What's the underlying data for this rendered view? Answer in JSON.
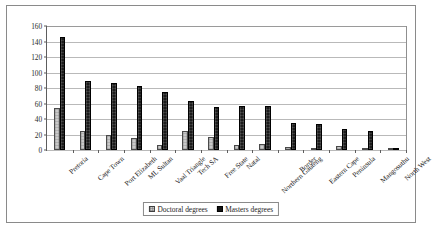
{
  "chart_data": {
    "type": "bar",
    "title": "",
    "subtitle": "",
    "xlabel": "",
    "ylabel": "",
    "ylim": [
      0,
      160
    ],
    "ytick_values": [
      0,
      20,
      40,
      60,
      80,
      100,
      120,
      140,
      160
    ],
    "ytick_labels": [
      "0",
      "20",
      "40",
      "60",
      "80",
      "100",
      "120",
      "140",
      "160"
    ],
    "grid": "horizontal",
    "legend_position": "bottom-center",
    "categories": [
      "Pretoria",
      "Cape Town",
      "Port Elizabeth",
      "ML Sultan",
      "Vaal Triangle",
      "Tech SA",
      "Free State",
      "Natal",
      "Northern Gauteng",
      "Border",
      "Eastern Cape",
      "Peninsula",
      "Mangosuthu",
      "North West"
    ],
    "series": [
      {
        "name": "Doctoral degrees",
        "color": "#c9c9c9",
        "values": [
          54,
          25,
          20,
          16,
          7,
          25,
          17,
          7,
          8,
          4,
          1,
          5,
          3,
          0
        ]
      },
      {
        "name": "Masters degrees",
        "color": "#1c1c1c",
        "values": [
          146,
          89,
          86,
          83,
          75,
          63,
          56,
          57,
          57,
          35,
          33,
          27,
          24,
          3
        ]
      }
    ]
  },
  "legend": {
    "entries": [
      {
        "label": "Doctoral degrees"
      },
      {
        "label": "Masters degrees"
      }
    ]
  }
}
